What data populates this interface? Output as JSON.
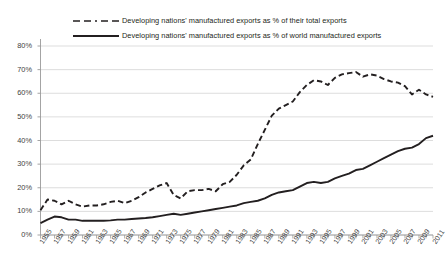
{
  "chart_data": {
    "type": "line",
    "title": "",
    "xlabel": "",
    "ylabel": "",
    "ylim": [
      0,
      80
    ],
    "xlim": [
      1955,
      2011
    ],
    "grid": true,
    "legend_position": "top",
    "ytick_labels": [
      "0%",
      "10%",
      "20%",
      "30%",
      "40%",
      "50%",
      "60%",
      "70%",
      "80%"
    ],
    "ytick_values": [
      0,
      10,
      20,
      30,
      40,
      50,
      60,
      70,
      80
    ],
    "xtick_labels": [
      "1955",
      "1957",
      "1959",
      "1961",
      "1963",
      "1965",
      "1967",
      "1969",
      "1971",
      "1973",
      "1975",
      "1977",
      "1979",
      "1981",
      "1983",
      "1985",
      "1987",
      "1989",
      "1991",
      "1993",
      "1995",
      "1997",
      "1999",
      "2001",
      "2003",
      "2005",
      "2007",
      "2009",
      "2011"
    ],
    "x": [
      1955,
      1956,
      1957,
      1958,
      1959,
      1960,
      1961,
      1962,
      1963,
      1964,
      1965,
      1966,
      1967,
      1968,
      1969,
      1970,
      1971,
      1972,
      1973,
      1974,
      1975,
      1976,
      1977,
      1978,
      1979,
      1980,
      1981,
      1982,
      1983,
      1984,
      1985,
      1986,
      1987,
      1988,
      1989,
      1990,
      1991,
      1992,
      1993,
      1994,
      1995,
      1996,
      1997,
      1998,
      1999,
      2000,
      2001,
      2002,
      2003,
      2004,
      2005,
      2006,
      2007,
      2008,
      2009,
      2010,
      2011
    ],
    "series": [
      {
        "name": "Developing nations' manufactured exports as % of their total exports",
        "style": "dashed",
        "color": "#231f20",
        "values": [
          10.5,
          15.0,
          14.5,
          13.0,
          14.5,
          13.0,
          12.0,
          12.5,
          12.5,
          13.0,
          14.0,
          14.5,
          13.5,
          14.5,
          16.0,
          18.0,
          19.5,
          21.0,
          22.0,
          17.0,
          15.5,
          18.5,
          19.0,
          19.0,
          19.5,
          18.5,
          21.5,
          22.5,
          25.5,
          29.5,
          32.0,
          38.5,
          44.5,
          50.5,
          53.5,
          55.0,
          56.5,
          60.5,
          63.5,
          65.5,
          65.0,
          63.5,
          66.5,
          68.0,
          68.5,
          69.0,
          67.0,
          68.0,
          67.5,
          66.0,
          65.0,
          64.5,
          63.0,
          59.5,
          61.5,
          59.5,
          58.5
        ]
      },
      {
        "name": "Developing nations' manufactured exports as % of world manufactured exports",
        "style": "solid",
        "color": "#231f20",
        "values": [
          5.0,
          6.5,
          7.8,
          7.5,
          6.5,
          6.5,
          6.0,
          6.0,
          6.0,
          6.0,
          6.2,
          6.5,
          6.5,
          6.8,
          7.0,
          7.2,
          7.5,
          8.0,
          8.5,
          9.0,
          8.5,
          9.0,
          9.5,
          10.0,
          10.5,
          11.0,
          11.5,
          12.0,
          12.5,
          13.5,
          14.0,
          14.5,
          15.5,
          17.0,
          18.0,
          18.5,
          19.0,
          20.5,
          22.0,
          22.5,
          22.0,
          22.5,
          24.0,
          25.0,
          26.0,
          27.5,
          28.0,
          29.5,
          31.0,
          32.5,
          34.0,
          35.5,
          36.5,
          37.0,
          38.5,
          41.0,
          42.0
        ]
      }
    ]
  },
  "legend": {
    "items": [
      {
        "label": "Developing nations' manufactured exports as % of their total exports",
        "style": "dashed"
      },
      {
        "label": "Developing nations' manufactured exports as % of world manufactured exports",
        "style": "solid"
      }
    ]
  }
}
